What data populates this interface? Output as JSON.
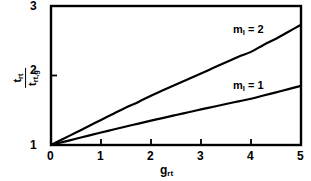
{
  "chart_data": {
    "type": "line",
    "title": "",
    "subtitle": "",
    "xlabel": "grt",
    "xlabel_base": "g",
    "xlabel_sub": "rt",
    "ylabel": "trt / trt,g",
    "ylabel_numerator_base": "t",
    "ylabel_numerator_sub": "rt",
    "ylabel_denominator_base": "t",
    "ylabel_denominator_sub": "rt,g",
    "xlim": [
      0,
      5
    ],
    "ylim": [
      1,
      3
    ],
    "xticks": [
      0,
      1,
      2,
      3,
      4,
      5
    ],
    "xtick_labels": [
      "0",
      "1",
      "2",
      "3",
      "4",
      "5"
    ],
    "yticks": [
      1,
      2,
      3
    ],
    "ytick_labels": [
      "1",
      "2",
      "3"
    ],
    "grid": false,
    "legend_position": "inline-annotations",
    "line_color": "#000000",
    "frame_color": "#000000",
    "background_color": "#ffffff",
    "series": [
      {
        "name": "ml = 2",
        "label_base": "m",
        "label_sub": "l",
        "label_value": "= 2",
        "x": [
          0,
          0.25,
          0.5,
          0.75,
          1.0,
          1.25,
          1.5,
          1.75,
          2.0,
          2.25,
          2.5,
          2.75,
          3.0,
          3.25,
          3.5,
          3.75,
          4.0,
          4.25,
          4.5,
          4.75,
          5.0
        ],
        "values": [
          1.0,
          1.09,
          1.18,
          1.27,
          1.36,
          1.45,
          1.54,
          1.62,
          1.71,
          1.79,
          1.87,
          1.95,
          2.03,
          2.11,
          2.19,
          2.27,
          2.34,
          2.44,
          2.53,
          2.63,
          2.73
        ]
      },
      {
        "name": "ml = 1",
        "label_base": "m",
        "label_sub": "l",
        "label_value": "= 1",
        "x": [
          0,
          0.25,
          0.5,
          0.75,
          1.0,
          1.25,
          1.5,
          1.75,
          2.0,
          2.25,
          2.5,
          2.75,
          3.0,
          3.25,
          3.5,
          3.75,
          4.0,
          4.25,
          4.5,
          4.75,
          5.0
        ],
        "values": [
          1.0,
          1.045,
          1.09,
          1.135,
          1.18,
          1.223,
          1.266,
          1.308,
          1.35,
          1.391,
          1.432,
          1.472,
          1.512,
          1.551,
          1.59,
          1.628,
          1.665,
          1.712,
          1.758,
          1.804,
          1.85
        ]
      }
    ],
    "annotations": [
      {
        "text": "ml = 2",
        "x": 4.0,
        "y": 2.82
      },
      {
        "text": "ml = 1",
        "x": 4.0,
        "y": 2.05
      }
    ]
  }
}
